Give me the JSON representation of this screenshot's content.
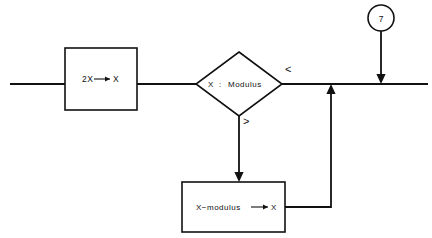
{
  "diagram": {
    "background_color": "#ffffff",
    "line_color": "#111111",
    "process_double": {
      "label_left": "2X",
      "label_right": "X",
      "arrow_glyph": "arrow-right"
    },
    "decision": {
      "operand_left": "X",
      "separator": ":",
      "operand_right": "Modulus",
      "label_less_than": "<",
      "label_greater_than": ">"
    },
    "process_subtract": {
      "label_left": "X−modulus",
      "label_right": "X",
      "arrow_glyph": "arrow-right"
    },
    "connector": {
      "label": "7"
    }
  }
}
